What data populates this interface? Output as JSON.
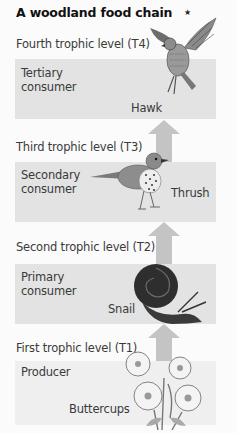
{
  "title": "A woodland food chain",
  "marker": "★",
  "levels": [
    {
      "id": "T4",
      "label": "Fourth trophic level (T4)",
      "role": "Tertiary consumer",
      "role_lines": [
        "Tertiary",
        "consumer"
      ],
      "organism": "Hawk",
      "illustration": "hawk-illustration"
    },
    {
      "id": "T3",
      "label": "Third trophic level (T3)",
      "role": "Secondary consumer",
      "role_lines": [
        "Secondary",
        "consumer"
      ],
      "organism": "Thrush",
      "illustration": "thrush-illustration"
    },
    {
      "id": "T2",
      "label": "Second trophic level (T2)",
      "role": "Primary consumer",
      "role_lines": [
        "Primary",
        "consumer"
      ],
      "organism": "Snail",
      "illustration": "snail-illustration"
    },
    {
      "id": "T1",
      "label": "First trophic level (T1)",
      "role": "Producer",
      "role_lines": [
        "Producer"
      ],
      "organism": "Buttercups",
      "illustration": "buttercups-illustration"
    }
  ],
  "colors": {
    "box": "#e3e3e3",
    "producer_box": "#efefef",
    "arrow": "#c4c4c4",
    "background": "#fbfbfb"
  }
}
